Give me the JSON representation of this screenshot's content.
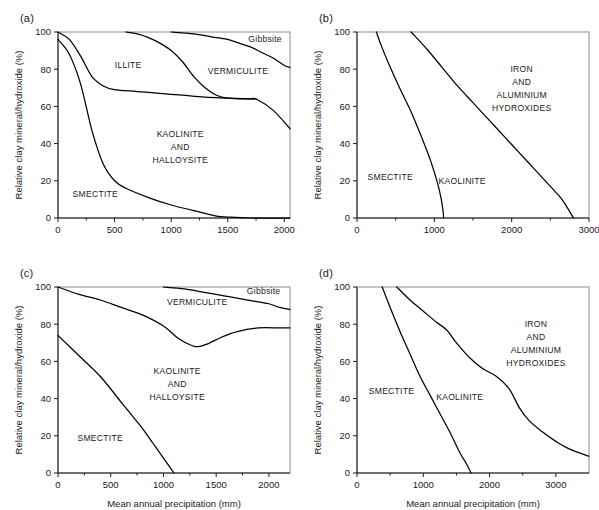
{
  "figure": {
    "shared_ylabel": "Relative clay mineral/hydroxide (%)",
    "shared_xlabel": "Mean annual precipitation (mm)",
    "ink_color": "#000000",
    "frame_color": "#8c8c8c",
    "background": "#ffffff"
  },
  "panels": [
    {
      "id": "a",
      "label": "(a)",
      "xlabel": "",
      "ylabel": "Relative clay mineral/hydroxide (%)",
      "xlim": [
        0,
        2050
      ],
      "ylim": [
        0,
        100
      ],
      "xticks": [
        0,
        500,
        1000,
        1500,
        2000
      ],
      "xticklabels": [
        "0",
        "500",
        "1000",
        "1500",
        "2000"
      ],
      "yticks": [
        0,
        20,
        40,
        60,
        80,
        100
      ],
      "yticklabels": [
        "0",
        "20",
        "40",
        "60",
        "80",
        "100"
      ],
      "region_labels": [
        {
          "text": "ILLITE",
          "x": 620,
          "y": 82
        },
        {
          "text": "VERMICULITE",
          "x": 1590,
          "y": 79
        },
        {
          "text": "Gibbsite",
          "x": 1830,
          "y": 96
        },
        {
          "text": "KAOLINITE",
          "x": 1080,
          "y": 45
        },
        {
          "text": "AND",
          "x": 1080,
          "y": 38
        },
        {
          "text": "HALLOYSITE",
          "x": 1080,
          "y": 31
        },
        {
          "text": "SMECTITE",
          "x": 330,
          "y": 13
        }
      ]
    },
    {
      "id": "b",
      "label": "(b)",
      "xlabel": "",
      "ylabel": "Relative clay mineral/hydroxide (%)",
      "xlim": [
        0,
        3000
      ],
      "ylim": [
        0,
        100
      ],
      "xticks": [
        0,
        1000,
        2000,
        3000
      ],
      "xticklabels": [
        "0",
        "1000",
        "2000",
        "3000"
      ],
      "yticks": [
        0,
        20,
        40,
        60,
        80,
        100
      ],
      "yticklabels": [
        "0",
        "20",
        "40",
        "60",
        "80",
        "100"
      ],
      "region_labels": [
        {
          "text": "IRON",
          "x": 2130,
          "y": 80
        },
        {
          "text": "AND",
          "x": 2130,
          "y": 73
        },
        {
          "text": "ALUMINIUM",
          "x": 2130,
          "y": 66
        },
        {
          "text": "HYDROXIDES",
          "x": 2130,
          "y": 59
        },
        {
          "text": "SMECTITE",
          "x": 430,
          "y": 22
        },
        {
          "text": "KAOLINITE",
          "x": 1360,
          "y": 20
        }
      ]
    },
    {
      "id": "c",
      "label": "(c)",
      "xlabel": "Mean annual precipitation (mm)",
      "ylabel": "Relative clay mineral/hydroxide (%)",
      "xlim": [
        0,
        2200
      ],
      "ylim": [
        0,
        100
      ],
      "xticks": [
        0,
        500,
        1000,
        1500,
        2000
      ],
      "xticklabels": [
        "0",
        "500",
        "1000",
        "1500",
        "2000"
      ],
      "yticks": [
        0,
        20,
        40,
        60,
        80,
        100
      ],
      "yticklabels": [
        "0",
        "20",
        "40",
        "60",
        "80",
        "100"
      ],
      "region_labels": [
        {
          "text": "VERMICULITE",
          "x": 1320,
          "y": 92
        },
        {
          "text": "Gibbsite",
          "x": 1950,
          "y": 98
        },
        {
          "text": "KAOLINITE",
          "x": 1130,
          "y": 55
        },
        {
          "text": "AND",
          "x": 1130,
          "y": 48
        },
        {
          "text": "HALLOYSITE",
          "x": 1130,
          "y": 41
        },
        {
          "text": "SMECTITE",
          "x": 400,
          "y": 19
        }
      ]
    },
    {
      "id": "d",
      "label": "(d)",
      "xlabel": "Mean annual precipitation (mm)",
      "ylabel": "Relative clay mineral/hydroxide (%)",
      "xlim": [
        0,
        3500
      ],
      "ylim": [
        0,
        100
      ],
      "xticks": [
        0,
        1000,
        2000,
        3000
      ],
      "xticklabels": [
        "0",
        "1000",
        "2000",
        "3000"
      ],
      "yticks": [
        0,
        20,
        40,
        60,
        80,
        100
      ],
      "yticklabels": [
        "0",
        "20",
        "40",
        "60",
        "80",
        "100"
      ],
      "region_labels": [
        {
          "text": "IRON",
          "x": 2700,
          "y": 80
        },
        {
          "text": "AND",
          "x": 2700,
          "y": 73
        },
        {
          "text": "ALUMINIUM",
          "x": 2700,
          "y": 66
        },
        {
          "text": "HYDROXIDES",
          "x": 2700,
          "y": 59
        },
        {
          "text": "SMECTITE",
          "x": 520,
          "y": 44
        },
        {
          "text": "KAOLINITE",
          "x": 1550,
          "y": 41
        }
      ]
    }
  ],
  "chart_data": [
    {
      "type": "line",
      "panel": "a",
      "title": "(a)",
      "xlabel": "Mean annual precipitation (mm)",
      "ylabel": "Relative clay mineral/hydroxide (%)",
      "xlim": [
        0,
        2050
      ],
      "ylim": [
        0,
        100
      ],
      "grid": false,
      "legend": "none",
      "annotations": [
        "ILLITE",
        "VERMICULITE",
        "Gibbsite",
        "KAOLINITE AND HALLOYSITE",
        "SMECTITE"
      ],
      "series": [
        {
          "name": "smectite-upper-boundary",
          "x": [
            0,
            100,
            200,
            300,
            400,
            500,
            600,
            800,
            1000,
            1200,
            1400,
            1500,
            1700,
            2050
          ],
          "values": [
            96,
            88,
            72,
            47,
            29,
            20,
            16,
            11,
            7,
            4,
            1,
            0.5,
            0,
            0
          ]
        },
        {
          "name": "illite-kaolinite-boundary",
          "x": [
            0,
            100,
            200,
            300,
            400,
            500,
            700,
            900,
            1100,
            1300,
            1500,
            1700,
            1750
          ],
          "values": [
            100,
            96,
            87,
            76,
            71,
            69,
            68,
            67,
            66,
            65,
            64.5,
            64,
            64
          ]
        },
        {
          "name": "vermiculite-kaolinite-boundary",
          "x": [
            600,
            700,
            800,
            900,
            1000,
            1100,
            1200,
            1300,
            1400,
            1500,
            1700,
            1750,
            1900,
            2050
          ],
          "values": [
            100,
            99,
            97,
            94,
            90,
            84,
            76,
            70,
            66,
            64.5,
            64,
            64,
            58,
            48
          ]
        },
        {
          "name": "gibbsite-vermiculite-boundary",
          "x": [
            1000,
            1200,
            1400,
            1500,
            1600,
            1700,
            1800,
            1900,
            2000,
            2050
          ],
          "values": [
            100,
            99,
            97,
            96,
            94,
            92,
            89,
            86,
            82,
            81
          ]
        }
      ]
    },
    {
      "type": "line",
      "panel": "b",
      "title": "(b)",
      "xlabel": "Mean annual precipitation (mm)",
      "ylabel": "Relative clay mineral/hydroxide (%)",
      "xlim": [
        0,
        3000
      ],
      "ylim": [
        0,
        100
      ],
      "grid": false,
      "legend": "none",
      "annotations": [
        "IRON AND ALUMINIUM HYDROXIDES",
        "SMECTITE",
        "KAOLINITE"
      ],
      "series": [
        {
          "name": "smectite-kaolinite-boundary",
          "x": [
            250,
            320,
            420,
            550,
            700,
            830,
            950,
            1040,
            1090,
            1115,
            1120
          ],
          "values": [
            100,
            92,
            82,
            70,
            57,
            44,
            31,
            19,
            10,
            3,
            0
          ]
        },
        {
          "name": "kaolinite-hydroxides-boundary",
          "x": [
            700,
            900,
            1100,
            1300,
            1500,
            1700,
            1900,
            2100,
            2300,
            2500,
            2650,
            2800
          ],
          "values": [
            100,
            91,
            81,
            71,
            62,
            53,
            44,
            35,
            26,
            17,
            10,
            0
          ]
        }
      ]
    },
    {
      "type": "line",
      "panel": "c",
      "title": "(c)",
      "xlabel": "Mean annual precipitation (mm)",
      "ylabel": "Relative clay mineral/hydroxide (%)",
      "xlim": [
        0,
        2200
      ],
      "ylim": [
        0,
        100
      ],
      "grid": false,
      "legend": "none",
      "annotations": [
        "VERMICULITE",
        "Gibbsite",
        "KAOLINITE AND HALLOYSITE",
        "SMECTITE"
      ],
      "series": [
        {
          "name": "smectite-kaolinite-boundary",
          "x": [
            0,
            200,
            400,
            600,
            700,
            800,
            900,
            1000,
            1050,
            1100
          ],
          "values": [
            74,
            63,
            52,
            38,
            31,
            24,
            16,
            8,
            4,
            0
          ]
        },
        {
          "name": "vermiculite-kaolinite-boundary",
          "x": [
            0,
            200,
            400,
            600,
            800,
            1000,
            1150,
            1300,
            1400,
            1550,
            1700,
            1900,
            2100,
            2200
          ],
          "values": [
            100,
            96,
            93,
            89,
            85,
            79,
            72,
            68,
            69,
            73,
            76,
            78,
            78,
            78
          ]
        },
        {
          "name": "gibbsite-vermiculite-boundary",
          "x": [
            1000,
            1200,
            1400,
            1600,
            1800,
            2000,
            2100,
            2200
          ],
          "values": [
            100,
            99,
            97,
            95,
            93,
            91,
            89,
            88
          ]
        }
      ]
    },
    {
      "type": "line",
      "panel": "d",
      "title": "(d)",
      "xlabel": "Mean annual precipitation (mm)",
      "ylabel": "Relative clay mineral/hydroxide (%)",
      "xlim": [
        0,
        3500
      ],
      "ylim": [
        0,
        100
      ],
      "grid": false,
      "legend": "none",
      "annotations": [
        "IRON AND ALUMINIUM HYDROXIDES",
        "SMECTITE",
        "KAOLINITE"
      ],
      "series": [
        {
          "name": "smectite-kaolinite-boundary",
          "x": [
            380,
            500,
            650,
            800,
            950,
            1100,
            1250,
            1400,
            1550,
            1650,
            1720
          ],
          "values": [
            100,
            89,
            76,
            64,
            52,
            42,
            32,
            22,
            11,
            5,
            0
          ]
        },
        {
          "name": "kaolinite-hydroxides-boundary",
          "x": [
            600,
            800,
            1000,
            1200,
            1350,
            1500,
            1700,
            1900,
            2100,
            2300,
            2450,
            2600,
            2800,
            3000,
            3200,
            3500
          ],
          "values": [
            100,
            93,
            87,
            81,
            77,
            70,
            62,
            56,
            52,
            45,
            35,
            28,
            22,
            17,
            13,
            9
          ]
        }
      ]
    }
  ]
}
